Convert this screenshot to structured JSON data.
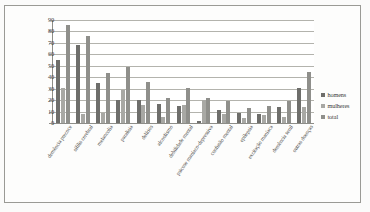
{
  "chart_data": {
    "type": "bar",
    "title": "",
    "subtitle": "",
    "xlabel": "",
    "ylabel": "",
    "ylim": [
      0,
      90
    ],
    "ytick_step": 10,
    "yticks": [
      90,
      80,
      70,
      60,
      50,
      40,
      30,
      20,
      10,
      0
    ],
    "grid": true,
    "legend_position": "right",
    "categories": [
      "demência precoce",
      "sífilis cerebral",
      "melancolia",
      "paralisia",
      "delírios",
      "alcoolismo",
      "debilidade mental",
      "psicose maníaco-depressiva",
      "confusão mental",
      "epilepsia",
      "excitação maníaca",
      "demência senil",
      "outras doenças"
    ],
    "series": [
      {
        "name": "homens",
        "color": "#6e6e6b",
        "values": [
          55,
          68,
          35,
          20,
          20,
          17,
          15,
          2,
          11,
          9,
          8,
          14,
          31
        ]
      },
      {
        "name": "mulheres",
        "color": "#a8a8a4",
        "values": [
          31,
          8,
          9,
          29,
          16,
          5,
          16,
          20,
          8,
          4,
          7,
          5,
          14
        ]
      },
      {
        "name": "total",
        "color": "#8f8f8b",
        "values": [
          86,
          76,
          44,
          49,
          36,
          22,
          31,
          22,
          19,
          13,
          15,
          19,
          45
        ]
      }
    ]
  },
  "legend": {
    "items": [
      {
        "label": "homens",
        "key": "homens"
      },
      {
        "label": "mulheres",
        "key": "mulheres"
      },
      {
        "label": "total",
        "key": "total"
      }
    ]
  },
  "colors": {
    "homens": "#6e6e6b",
    "mulheres": "#a8a8a4",
    "total": "#8f8f8b",
    "grid": "#b3b3ad",
    "axis": "#8d8d88",
    "text": "#3b3b38",
    "page_background": "#fbfbfa",
    "plot_background": "#ffffff",
    "border": "#9a9a95"
  }
}
